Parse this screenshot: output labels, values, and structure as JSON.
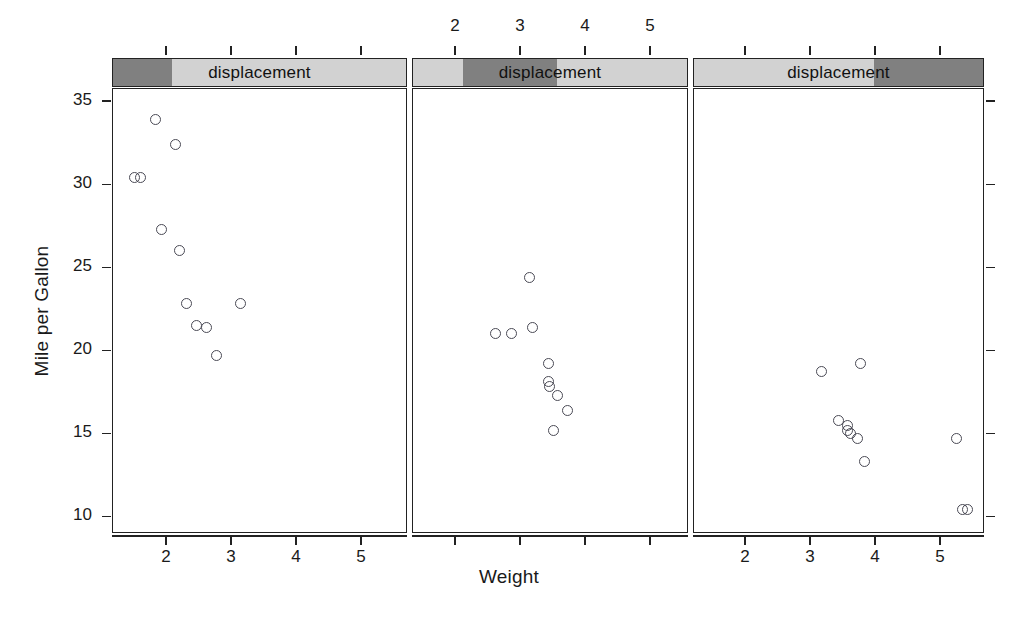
{
  "figure": {
    "width": 1018,
    "height": 643,
    "background": "#ffffff"
  },
  "labels": {
    "ylab": "Mile per Gallon",
    "xlab": "Weight",
    "strip_label": "displacement"
  },
  "colors": {
    "strip_light": "#d2d2d2",
    "strip_dark": "#808080",
    "frame": "#222222",
    "point": "#4a4a55",
    "text": "#1a1a1a"
  },
  "chart_data": {
    "type": "scatter",
    "title": "",
    "xlabel": "Weight",
    "ylabel": "Mile per Gallon",
    "xlim": [
      1.4,
      5.6
    ],
    "ylim": [
      9.0,
      35.8
    ],
    "grid": false,
    "legend": false,
    "conditioning_variable": "displacement",
    "conditioning_type": "shingle",
    "x_ticks": [
      2,
      3,
      4,
      5
    ],
    "x_ticklabels": [
      "2",
      "3",
      "4",
      "5"
    ],
    "y_ticks": [
      10,
      15,
      20,
      25,
      30,
      35
    ],
    "y_ticklabels": [
      "10",
      "15",
      "20",
      "25",
      "30",
      "35"
    ],
    "panels": [
      {
        "index": 1,
        "strip_label": "displacement",
        "strip_fraction_start": 0.0,
        "strip_fraction_end": 0.2,
        "x_axis_labels_visible": true,
        "x_axis_labels_position": "bottom",
        "points": [
          {
            "x": 1.513,
            "y": 30.4
          },
          {
            "x": 1.615,
            "y": 30.4
          },
          {
            "x": 1.835,
            "y": 33.9
          },
          {
            "x": 1.935,
            "y": 27.3
          },
          {
            "x": 2.14,
            "y": 32.4
          },
          {
            "x": 2.2,
            "y": 26.0
          },
          {
            "x": 2.32,
            "y": 22.8
          },
          {
            "x": 2.465,
            "y": 21.5
          },
          {
            "x": 2.62,
            "y": 21.4
          },
          {
            "x": 2.77,
            "y": 19.7
          },
          {
            "x": 3.15,
            "y": 22.8
          }
        ]
      },
      {
        "index": 2,
        "strip_label": "displacement",
        "strip_fraction_start": 0.18,
        "strip_fraction_end": 0.52,
        "x_axis_labels_visible": true,
        "x_axis_labels_position": "top",
        "points": [
          {
            "x": 2.62,
            "y": 21.0
          },
          {
            "x": 2.875,
            "y": 21.0
          },
          {
            "x": 3.15,
            "y": 24.4
          },
          {
            "x": 3.19,
            "y": 21.4
          },
          {
            "x": 3.44,
            "y": 19.2
          },
          {
            "x": 3.44,
            "y": 18.1
          },
          {
            "x": 3.46,
            "y": 17.8
          },
          {
            "x": 3.57,
            "y": 17.3
          },
          {
            "x": 3.73,
            "y": 16.4
          },
          {
            "x": 3.52,
            "y": 15.2
          }
        ]
      },
      {
        "index": 3,
        "strip_label": "displacement",
        "strip_fraction_start": 0.62,
        "strip_fraction_end": 1.0,
        "x_axis_labels_visible": true,
        "x_axis_labels_position": "bottom",
        "points": [
          {
            "x": 3.17,
            "y": 18.7
          },
          {
            "x": 3.44,
            "y": 15.8
          },
          {
            "x": 3.57,
            "y": 15.5
          },
          {
            "x": 3.57,
            "y": 15.2
          },
          {
            "x": 3.63,
            "y": 15.0
          },
          {
            "x": 3.78,
            "y": 19.2
          },
          {
            "x": 3.73,
            "y": 14.7
          },
          {
            "x": 3.84,
            "y": 13.3
          },
          {
            "x": 5.25,
            "y": 14.7
          },
          {
            "x": 5.345,
            "y": 10.4
          },
          {
            "x": 5.43,
            "y": 10.4
          }
        ]
      }
    ]
  }
}
